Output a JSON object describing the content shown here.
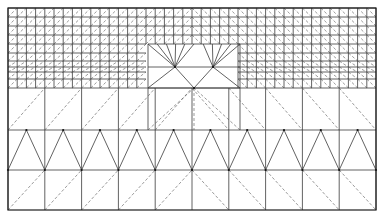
{
  "figure": {
    "type": "finite-element-mesh",
    "domain": {
      "x0": 8,
      "y0": 8,
      "x1": 376,
      "y1": 210
    },
    "colors": {
      "edge": "#3a3a3a",
      "diagonal": "#555555",
      "border": "#1e1e1e",
      "background": "#ffffff"
    },
    "fine_region": {
      "cols": 40,
      "rows_y": [
        8,
        17,
        26,
        35,
        44,
        53,
        61,
        67,
        72,
        79,
        88
      ]
    },
    "coarse_region": {
      "cols": 10,
      "rows_y": [
        88,
        130,
        170,
        210
      ]
    },
    "star_patch": {
      "x0": 148,
      "x1": 240,
      "y0": 44,
      "y1": 130,
      "centers": [
        [
          175,
          67
        ],
        [
          213,
          67
        ]
      ],
      "mid": [
        194,
        90
      ]
    }
  }
}
